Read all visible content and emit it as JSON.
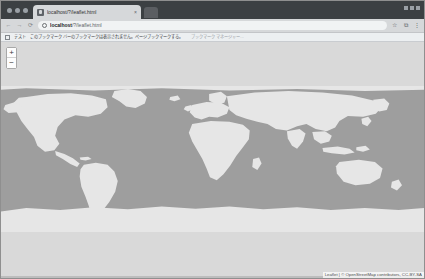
{
  "window": {
    "traffic_lights": [
      "close",
      "minimize",
      "maximize"
    ],
    "controls_right": [
      "minimize",
      "maximize",
      "close"
    ]
  },
  "tabs": [
    {
      "title": "localhost/?/leaflet.html",
      "favicon": "globe-icon",
      "close_label": "×",
      "active": true
    }
  ],
  "new_tab": {
    "label": "+"
  },
  "toolbar": {
    "back_icon": "←",
    "forward_icon": "→",
    "reload_icon": "⟳",
    "omnibox": {
      "site_info_icon": "info-circle-icon",
      "url_host": "localhost",
      "url_path": "/?/leaflet.html",
      "placeholder": "検索または URL を入力"
    },
    "star_icon": "☆",
    "extensions_icon": "⧉",
    "menu_icon": "⋮"
  },
  "infobar": {
    "icon": "bookmark-icon",
    "label": "テスト",
    "text": "このブックマーク バーのブックマークは表示されません。ページブックマークする。",
    "sub": "ブックマーク マネージャー..."
  },
  "map": {
    "zoom_in_label": "+",
    "zoom_out_label": "−",
    "zoom_in_title": "Zoom in",
    "zoom_out_title": "Zoom out",
    "attribution_prefix": "Leaflet",
    "attribution_separator": " | ",
    "attribution_text": "© OpenStreetMap contributors, CC-BY-SA",
    "ocean_color": "#9e9e9e",
    "land_color": "#e6e6e6",
    "background_color": "#d9d9d9",
    "projection": "Web Mercator",
    "zoom_level": "1"
  }
}
